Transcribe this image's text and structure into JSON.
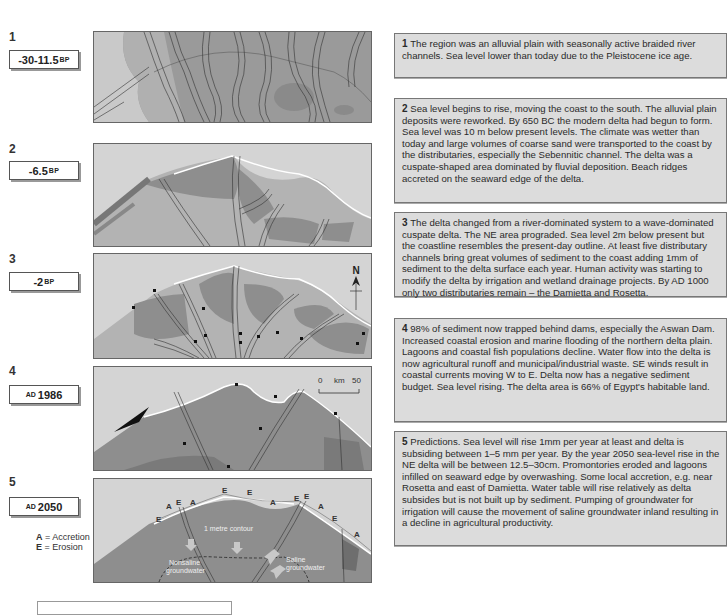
{
  "stages": [
    {
      "number": "1",
      "date": {
        "prefix": "",
        "value": "-30-11.5",
        "suffix": "BP"
      },
      "description": "The region was an alluvial plain with seasonally active braided river channels. Sea level lower than today due to the Pleistocene ice age."
    },
    {
      "number": "2",
      "date": {
        "prefix": "",
        "value": "-6.5",
        "suffix": "BP"
      },
      "description": "Sea level begins to rise, moving the coast to the south. The alluvial plain deposits were reworked. By 650 BC the modern delta had begun to form. Sea level was 10 m below present levels. The climate was wetter than today and large volumes of coarse sand were transported to the coast by the distributaries, especially the Sebennitic channel. The delta was a cuspate-shaped area dominated by fluvial deposition. Beach ridges accreted on the seaward edge of the delta."
    },
    {
      "number": "3",
      "date": {
        "prefix": "",
        "value": "-2",
        "suffix": "BP"
      },
      "description": "The delta changed from a river-dominated system to a wave-dominated cuspate delta. The NE area prograded. Sea level 2m below present but the coastline resembles the present-day outline. At least five distributary channels bring great volumes of sediment to the coast adding 1mm of sediment to the delta surface each year. Human activity was starting to modify the delta by irrigation and wetland drainage projects. By AD 1000 only two distributaries remain – the Damietta and Rosetta."
    },
    {
      "number": "4",
      "date": {
        "prefix": "AD",
        "value": "1986",
        "suffix": ""
      },
      "description": "98% of sediment now trapped behind dams, especially the Aswan Dam. Increased coastal erosion and marine flooding of the northern delta plain. Lagoons and coastal fish populations decline. Water flow into the delta is now agricultural runoff and municipal/industrial waste. SE winds result in coastal currents moving W to E. Delta now has a negative sediment budget. Sea level rising. The delta area is 66% of Egypt's habitable land."
    },
    {
      "number": "5",
      "date": {
        "prefix": "AD",
        "value": "2050",
        "suffix": ""
      },
      "description": "Predictions. Sea level will rise 1mm per year at least and delta is subsiding between 1–5 mm per year. By the year 2050 sea-level rise in the NE delta will be between 12.5–30cm. Promontories eroded and lagoons infilled on seaward edge by overwashing. Some local accretion, e.g. near Rosetta and east of Damietta. Water table will rise relatively as delta subsides but is not built up by sediment. Pumping of groundwater for irrigation will cause the movement of saline groundwater inland resulting in a decline in agricultural productivity."
    }
  ],
  "map_labels": {
    "north_arrow": "N",
    "scale": {
      "start": "0",
      "unit": "km",
      "end": "50"
    },
    "contour": "1 metre contour",
    "nonsaline": [
      "Nonsaline",
      "groundwater"
    ],
    "saline": [
      "Saline",
      "groundwater"
    ],
    "accretion_mark": "A",
    "erosion_mark": "E"
  },
  "legend": {
    "accretion": {
      "key": "A",
      "label": "= Accretion"
    },
    "erosion": {
      "key": "E",
      "label": "= Erosion"
    }
  },
  "colors": {
    "sea": "#d6d6d6",
    "land_light": "#b4b4b4",
    "land_dark": "#8c8c8c",
    "text_box_bg": "#dcdcdc"
  }
}
